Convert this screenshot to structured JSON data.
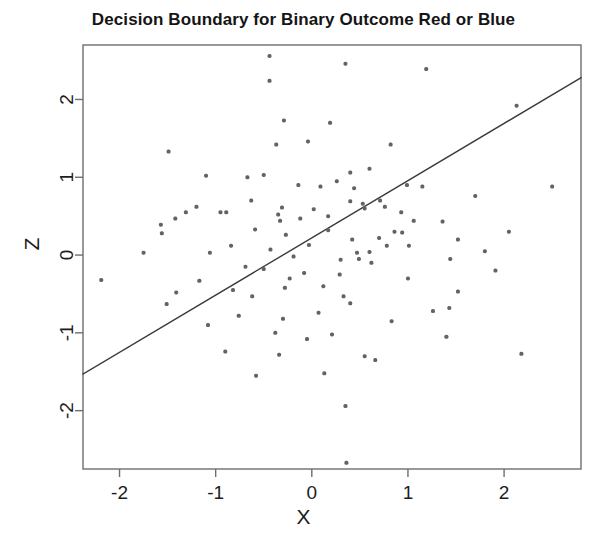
{
  "chart_data": {
    "type": "scatter",
    "title": "Decision Boundary for Binary Outcome Red or Blue",
    "xlabel": "X",
    "ylabel": "Z",
    "xlim": [
      -2.38,
      2.8
    ],
    "ylim": [
      -2.75,
      2.7
    ],
    "xticks": [
      -2,
      -1,
      0,
      1,
      2
    ],
    "xtick_labels": [
      "-2",
      "-1",
      "0",
      "1",
      "2"
    ],
    "yticks": [
      -2,
      -1,
      0,
      1,
      2
    ],
    "ytick_labels": [
      "-2",
      "-1",
      "0",
      "1",
      "2"
    ],
    "grid": false,
    "legend": null,
    "point_color": "#636363",
    "point_size": 4,
    "line_color": "#3a3a3a",
    "frame_color": "#6e6e6e",
    "annotations": [
      {
        "name": "decision-boundary",
        "type": "line",
        "x1": -2.38,
        "y1": -1.53,
        "x2": 2.8,
        "y2": 2.28,
        "color": "#3a3a3a",
        "width": 1.4
      }
    ],
    "series": [
      {
        "name": "observations",
        "color": "#636363",
        "points": [
          [
            -0.44,
            2.56
          ],
          [
            -0.44,
            2.24
          ],
          [
            0.35,
            2.46
          ],
          [
            1.19,
            2.39
          ],
          [
            2.13,
            1.92
          ],
          [
            -0.29,
            1.73
          ],
          [
            0.19,
            1.7
          ],
          [
            -1.49,
            1.33
          ],
          [
            -1.1,
            1.02
          ],
          [
            -0.67,
            1.0
          ],
          [
            0.6,
            1.11
          ],
          [
            0.99,
            0.9
          ],
          [
            2.5,
            0.88
          ],
          [
            1.15,
            0.88
          ],
          [
            -0.37,
            1.42
          ],
          [
            -1.57,
            0.39
          ],
          [
            -1.56,
            0.28
          ],
          [
            -0.95,
            0.55
          ],
          [
            -0.89,
            0.55
          ],
          [
            0.71,
            0.7
          ],
          [
            0.76,
            0.62
          ],
          [
            0.44,
            0.86
          ],
          [
            0.4,
            0.69
          ],
          [
            0.53,
            0.66
          ],
          [
            0.55,
            0.6
          ],
          [
            0.93,
            0.55
          ],
          [
            1.06,
            0.44
          ],
          [
            1.36,
            0.43
          ],
          [
            -0.59,
            0.33
          ],
          [
            -0.27,
            0.26
          ],
          [
            0.17,
            0.32
          ],
          [
            0.7,
            0.22
          ],
          [
            0.42,
            0.2
          ],
          [
            0.78,
            0.12
          ],
          [
            0.6,
            0.04
          ],
          [
            0.47,
            0.03
          ],
          [
            -1.06,
            0.03
          ],
          [
            -0.43,
            0.07
          ],
          [
            -0.03,
            0.13
          ],
          [
            0.3,
            -0.06
          ],
          [
            -2.19,
            -0.32
          ],
          [
            -1.17,
            -0.33
          ],
          [
            -0.23,
            -0.3
          ],
          [
            0.12,
            -0.4
          ],
          [
            1.52,
            0.2
          ],
          [
            1.44,
            -0.05
          ],
          [
            1.91,
            -0.2
          ],
          [
            -0.62,
            -0.53
          ],
          [
            -0.28,
            -0.42
          ],
          [
            0.33,
            -0.53
          ],
          [
            0.4,
            -0.62
          ],
          [
            1.52,
            -0.47
          ],
          [
            -1.51,
            -0.63
          ],
          [
            -0.76,
            -0.78
          ],
          [
            -0.3,
            -0.82
          ],
          [
            0.07,
            -0.74
          ],
          [
            0.83,
            -0.85
          ],
          [
            1.43,
            -0.68
          ],
          [
            -1.08,
            -0.9
          ],
          [
            -0.38,
            -1.0
          ],
          [
            0.21,
            -1.02
          ],
          [
            1.4,
            -1.05
          ],
          [
            2.18,
            -1.27
          ],
          [
            -0.9,
            -1.24
          ],
          [
            -0.34,
            -1.28
          ],
          [
            0.55,
            -1.3
          ],
          [
            -0.58,
            -1.55
          ],
          [
            0.35,
            -1.94
          ],
          [
            0.36,
            -2.67
          ],
          [
            -0.08,
            -0.23
          ],
          [
            -0.35,
            0.52
          ],
          [
            -0.31,
            0.61
          ],
          [
            -0.33,
            0.44
          ],
          [
            -0.12,
            0.47
          ],
          [
            -0.19,
            -0.02
          ],
          [
            0.02,
            0.59
          ],
          [
            -0.69,
            -0.15
          ],
          [
            -1.31,
            0.55
          ],
          [
            -1.42,
            0.47
          ],
          [
            -0.84,
            0.12
          ],
          [
            0.26,
            0.95
          ],
          [
            0.82,
            1.42
          ],
          [
            -0.82,
            -0.45
          ],
          [
            -0.5,
            -0.18
          ],
          [
            0.29,
            -0.25
          ],
          [
            -0.05,
            -1.08
          ],
          [
            0.62,
            -0.1
          ],
          [
            1.26,
            -0.72
          ],
          [
            2.05,
            0.3
          ],
          [
            -1.75,
            0.03
          ],
          [
            0.94,
            0.29
          ],
          [
            0.49,
            -0.05
          ],
          [
            0.17,
            0.5
          ],
          [
            1.01,
            0.12
          ],
          [
            -1.41,
            -0.48
          ],
          [
            -0.63,
            0.7
          ],
          [
            -0.14,
            0.9
          ],
          [
            0.4,
            1.06
          ],
          [
            1.7,
            0.76
          ],
          [
            0.66,
            -1.35
          ],
          [
            -0.04,
            1.46
          ],
          [
            0.86,
            0.3
          ],
          [
            0.09,
            0.88
          ],
          [
            -0.5,
            1.03
          ],
          [
            1.0,
            -0.3
          ],
          [
            0.13,
            -1.52
          ],
          [
            1.8,
            0.05
          ],
          [
            -1.2,
            0.62
          ]
        ]
      }
    ]
  }
}
